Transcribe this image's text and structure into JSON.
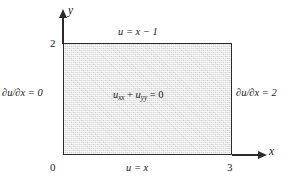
{
  "figure": {
    "colors": {
      "stroke": "#2b2b2b",
      "fill": "#e2e2e2",
      "background": "#ffffff",
      "text": "#1a1a1a"
    }
  },
  "axes": {
    "x_label": "x",
    "y_label": "y",
    "origin_label": "0",
    "x_max_label": "3",
    "y_max_label": "2"
  },
  "domain": {
    "x_range": [
      0,
      3
    ],
    "y_range": [
      0,
      2
    ],
    "pde": "uₓₓ + uᵧᵧ = 0",
    "pde_base_1": "u",
    "pde_sub_1": "xx",
    "pde_plus": " + ",
    "pde_base_2": "u",
    "pde_sub_2": "yy",
    "pde_tail": " = 0"
  },
  "boundary_conditions": {
    "top": "u = x − 1",
    "bottom": "u = x",
    "left": "∂u/∂x = 0",
    "right": "∂u/∂x = 2"
  }
}
